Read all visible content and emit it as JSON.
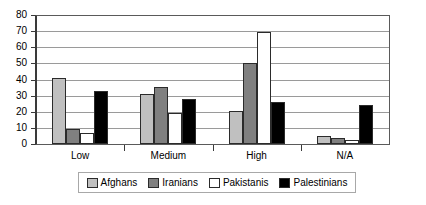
{
  "chart_data": {
    "type": "bar",
    "title": "",
    "subtitle": "",
    "xlabel": "",
    "ylabel": "",
    "categories": [
      "Low",
      "Medium",
      "High",
      "N/A"
    ],
    "series": [
      {
        "name": "Afghans",
        "color": "#c0c0c0",
        "values": [
          41,
          31,
          20.5,
          5
        ]
      },
      {
        "name": "Iranians",
        "color": "#808080",
        "values": [
          9.5,
          35.5,
          50.5,
          4
        ]
      },
      {
        "name": "Pakistanis",
        "color": "#ffffff",
        "values": [
          7,
          19.5,
          69.5,
          2.5
        ]
      },
      {
        "name": "Palestinians",
        "color": "#000000",
        "values": [
          33,
          28,
          26,
          24
        ]
      }
    ],
    "ylim": [
      0,
      80
    ],
    "ytick_step": 10,
    "yticks": [
      0,
      10,
      20,
      30,
      40,
      50,
      60,
      70,
      80
    ],
    "ytick_labels": [
      "0",
      "10",
      "20",
      "30",
      "40",
      "50",
      "60",
      "70",
      "80"
    ],
    "grid": true,
    "grid_axis": "y",
    "legend_position": "bottom",
    "annotations": []
  }
}
